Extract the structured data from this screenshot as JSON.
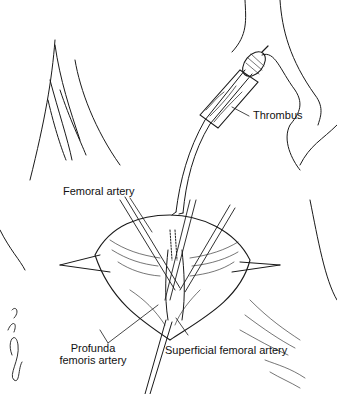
{
  "figure": {
    "labels": {
      "thrombus": "Thrombus",
      "femoral_artery": "Femoral artery",
      "profunda_line1": "Profunda",
      "profunda_line2": "femoris artery",
      "superficial_femoral_artery": "Superficial femoral artery"
    },
    "signature": "signature",
    "colors": {
      "ink": "#111111",
      "background": "#ffffff"
    }
  }
}
